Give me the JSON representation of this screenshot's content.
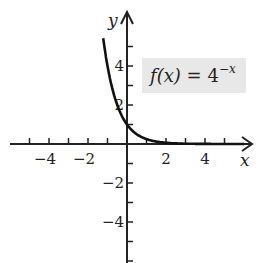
{
  "chart_data": {
    "type": "line",
    "title": "",
    "function": "f(x) = 4^(-x)",
    "label": {
      "lhs": "f(x)",
      "eq": "=",
      "base": "4",
      "exponent": "−x"
    },
    "xlabel": "x",
    "ylabel": "y",
    "xlim": [
      -6,
      6.5
    ],
    "ylim": [
      -6,
      6.5
    ],
    "xticks": [
      -5,
      -4,
      -3,
      -2,
      -1,
      1,
      2,
      3,
      4,
      5
    ],
    "xtick_labels": [
      "−4",
      "−2",
      "2",
      "4"
    ],
    "xtick_label_values": [
      -4,
      -2,
      2,
      4
    ],
    "yticks": [
      -6,
      -5,
      -4,
      -3,
      -2,
      -1,
      1,
      2,
      3,
      4,
      5
    ],
    "ytick_labels": [
      "4",
      "2",
      "−2",
      "−4"
    ],
    "ytick_label_values": [
      4,
      2,
      -2,
      -4
    ],
    "series": [
      {
        "name": "f(x) = 4^-x",
        "x": [
          -1.25,
          -1,
          -0.75,
          -0.5,
          -0.25,
          0,
          0.25,
          0.5,
          1,
          1.5,
          2,
          3,
          4,
          5,
          6
        ],
        "values": [
          5.66,
          4,
          2.83,
          2,
          1.41,
          1,
          0.71,
          0.5,
          0.25,
          0.125,
          0.0625,
          0.0156,
          0.0039,
          0.001,
          0.0002
        ]
      }
    ],
    "grid": false,
    "legend": "none"
  }
}
